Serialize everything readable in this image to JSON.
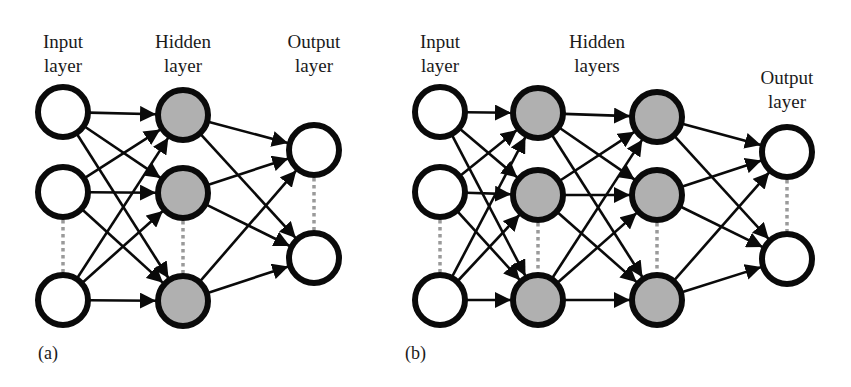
{
  "figure": {
    "panel_a": {
      "caption": "(a)",
      "layers": [
        {
          "name": "input",
          "label_line1": "Input",
          "label_line2": "layer",
          "label_x": 63,
          "label_y": 30,
          "x": 63,
          "nodes": [
            112,
            192,
            300
          ],
          "filled": false,
          "ellipsis_between": [
            1,
            2
          ]
        },
        {
          "name": "hidden",
          "label_line1": "Hidden",
          "label_line2": "layer",
          "label_x": 183,
          "label_y": 30,
          "x": 183,
          "nodes": [
            115,
            193,
            301
          ],
          "filled": true,
          "ellipsis_between": [
            1,
            2
          ]
        },
        {
          "name": "output",
          "label_line1": "Output",
          "label_line2": "layer",
          "label_x": 314,
          "label_y": 30,
          "x": 314,
          "nodes": [
            150,
            258
          ],
          "filled": false,
          "ellipsis_between": [
            0,
            1
          ]
        }
      ]
    },
    "panel_b": {
      "caption": "(b)",
      "layers": [
        {
          "name": "input",
          "label_line1": "Input",
          "label_line2": "layer",
          "label_x": 440,
          "label_y": 30,
          "x": 440,
          "nodes": [
            112,
            192,
            300
          ],
          "filled": false,
          "ellipsis_between": [
            1,
            2
          ]
        },
        {
          "name": "hidden-1",
          "x": 538,
          "nodes": [
            113,
            195,
            300
          ],
          "filled": true,
          "ellipsis_between": [
            1,
            2
          ]
        },
        {
          "name": "hidden-2",
          "x": 657,
          "nodes": [
            117,
            195,
            300
          ],
          "filled": true,
          "ellipsis_between": [
            1,
            2
          ]
        },
        {
          "name": "output",
          "label_line1": "Output",
          "label_line2": "layer",
          "label_x": 787,
          "label_y": 66,
          "x": 787,
          "nodes": [
            152,
            259
          ],
          "filled": false,
          "ellipsis_between": [
            0,
            1
          ]
        }
      ],
      "hidden_group_label_line1": "Hidden",
      "hidden_group_label_line2": "layers",
      "hidden_group_label_x": 597,
      "hidden_group_label_y": 30
    },
    "style": {
      "node_radius": 25,
      "node_stroke": "#0a0a0a",
      "node_stroke_width": 6,
      "hidden_fill": "#b0b0b0",
      "open_fill": "#ffffff",
      "edge_color": "#0a0a0a",
      "ellipsis_color": "#9a9a9a"
    }
  }
}
